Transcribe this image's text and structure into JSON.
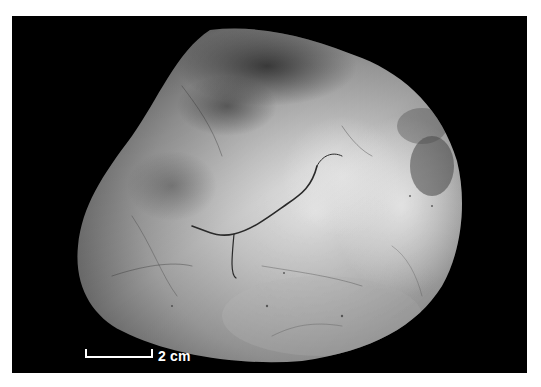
{
  "figure": {
    "background_color": "#000000",
    "border_color": "#ffffff",
    "scale_bar": {
      "label": "2 cm",
      "color": "#ffffff"
    },
    "tones": {
      "highlight": "#e8e8e8",
      "midtone": "#9a9a9a",
      "shadow": "#4a4a4a",
      "vessel": "#2a2a2a"
    }
  }
}
